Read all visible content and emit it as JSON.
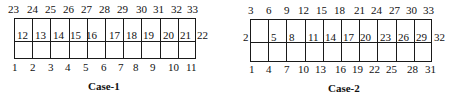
{
  "case1": {
    "caption": "Case-1",
    "top_labels": [
      "23",
      "24",
      "25",
      "26",
      "27",
      "28",
      "29",
      "30",
      "31",
      "32",
      "33"
    ],
    "mid_labels": [
      "12",
      "13",
      "14",
      "15",
      "16",
      "17",
      "18",
      "19",
      "20",
      "21"
    ],
    "right_label": "22",
    "bottom_labels": [
      "1",
      "2",
      "3",
      "4",
      "5",
      "6",
      "7",
      "8",
      "9",
      "10",
      "11"
    ]
  },
  "case2": {
    "caption": "Case-2",
    "top_labels": [
      "3",
      "6",
      "9",
      "12",
      "15",
      "18",
      "21",
      "24",
      "27",
      "30",
      "33"
    ],
    "left_label": "2",
    "mid_labels": [
      "5",
      "8",
      "11",
      "14",
      "17",
      "20",
      "23",
      "26",
      "29"
    ],
    "right_label": "32",
    "bottom_labels": [
      "1",
      "4",
      "7",
      "10",
      "13",
      "16",
      "19",
      "22",
      "25",
      "28",
      "31"
    ]
  }
}
